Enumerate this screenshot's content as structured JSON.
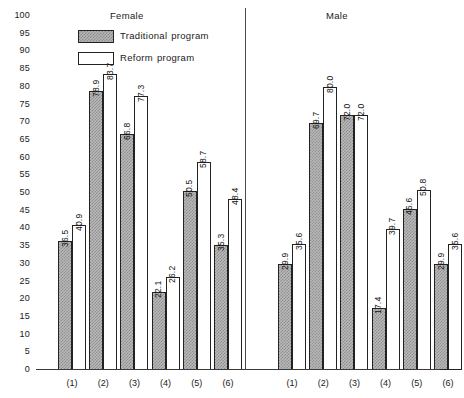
{
  "chart_data": {
    "type": "bar",
    "title": "",
    "xlabel": "",
    "ylabel": "",
    "ylim": [
      0,
      100
    ],
    "ytick_step": 5,
    "yticks": [
      100,
      95,
      90,
      85,
      80,
      75,
      70,
      65,
      60,
      55,
      50,
      45,
      40,
      35,
      30,
      25,
      20,
      15,
      10,
      5,
      0
    ],
    "grid": false,
    "legend_position": "top-left",
    "legend": [
      {
        "name": "Traditional program",
        "fill": "hatched-gray"
      },
      {
        "name": "Reform program",
        "fill": "white"
      }
    ],
    "panels": [
      {
        "name": "Female",
        "categories": [
          "(1)",
          "(2)",
          "(3)",
          "(4)",
          "(5)",
          "(6)"
        ],
        "series": [
          {
            "name": "Traditional program",
            "values": [
              36.5,
              78.9,
              66.8,
              22.1,
              50.5,
              35.3
            ]
          },
          {
            "name": "Reform program",
            "values": [
              40.9,
              83.7,
              77.3,
              26.2,
              58.7,
              48.4
            ]
          }
        ]
      },
      {
        "name": "Male",
        "categories": [
          "(1)",
          "(2)",
          "(3)",
          "(4)",
          "(5)",
          "(6)"
        ],
        "series": [
          {
            "name": "Traditional program",
            "values": [
              29.9,
              69.7,
              72.0,
              17.4,
              45.6,
              29.9
            ]
          },
          {
            "name": "Reform program",
            "values": [
              35.6,
              80.0,
              72.0,
              39.7,
              50.8,
              35.6
            ]
          }
        ]
      }
    ]
  },
  "colors": {
    "axis": "#3a3a3a",
    "bar_border": "#222222",
    "traditional_fill": "#b9b9b9",
    "reform_fill": "#ffffff",
    "text": "#111111"
  }
}
